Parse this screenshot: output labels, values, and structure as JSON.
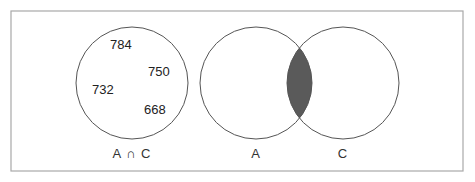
{
  "diagram": {
    "type": "venn",
    "frame": {
      "stroke": "#a8a8a8"
    },
    "left_panel": {
      "label": "A ∩ C",
      "values": [
        "784",
        "750",
        "732",
        "668"
      ]
    },
    "right_panel": {
      "sets": [
        {
          "label": "A"
        },
        {
          "label": "C"
        }
      ],
      "shaded_region": "intersection",
      "shade_color": "#5a5a5a"
    }
  }
}
